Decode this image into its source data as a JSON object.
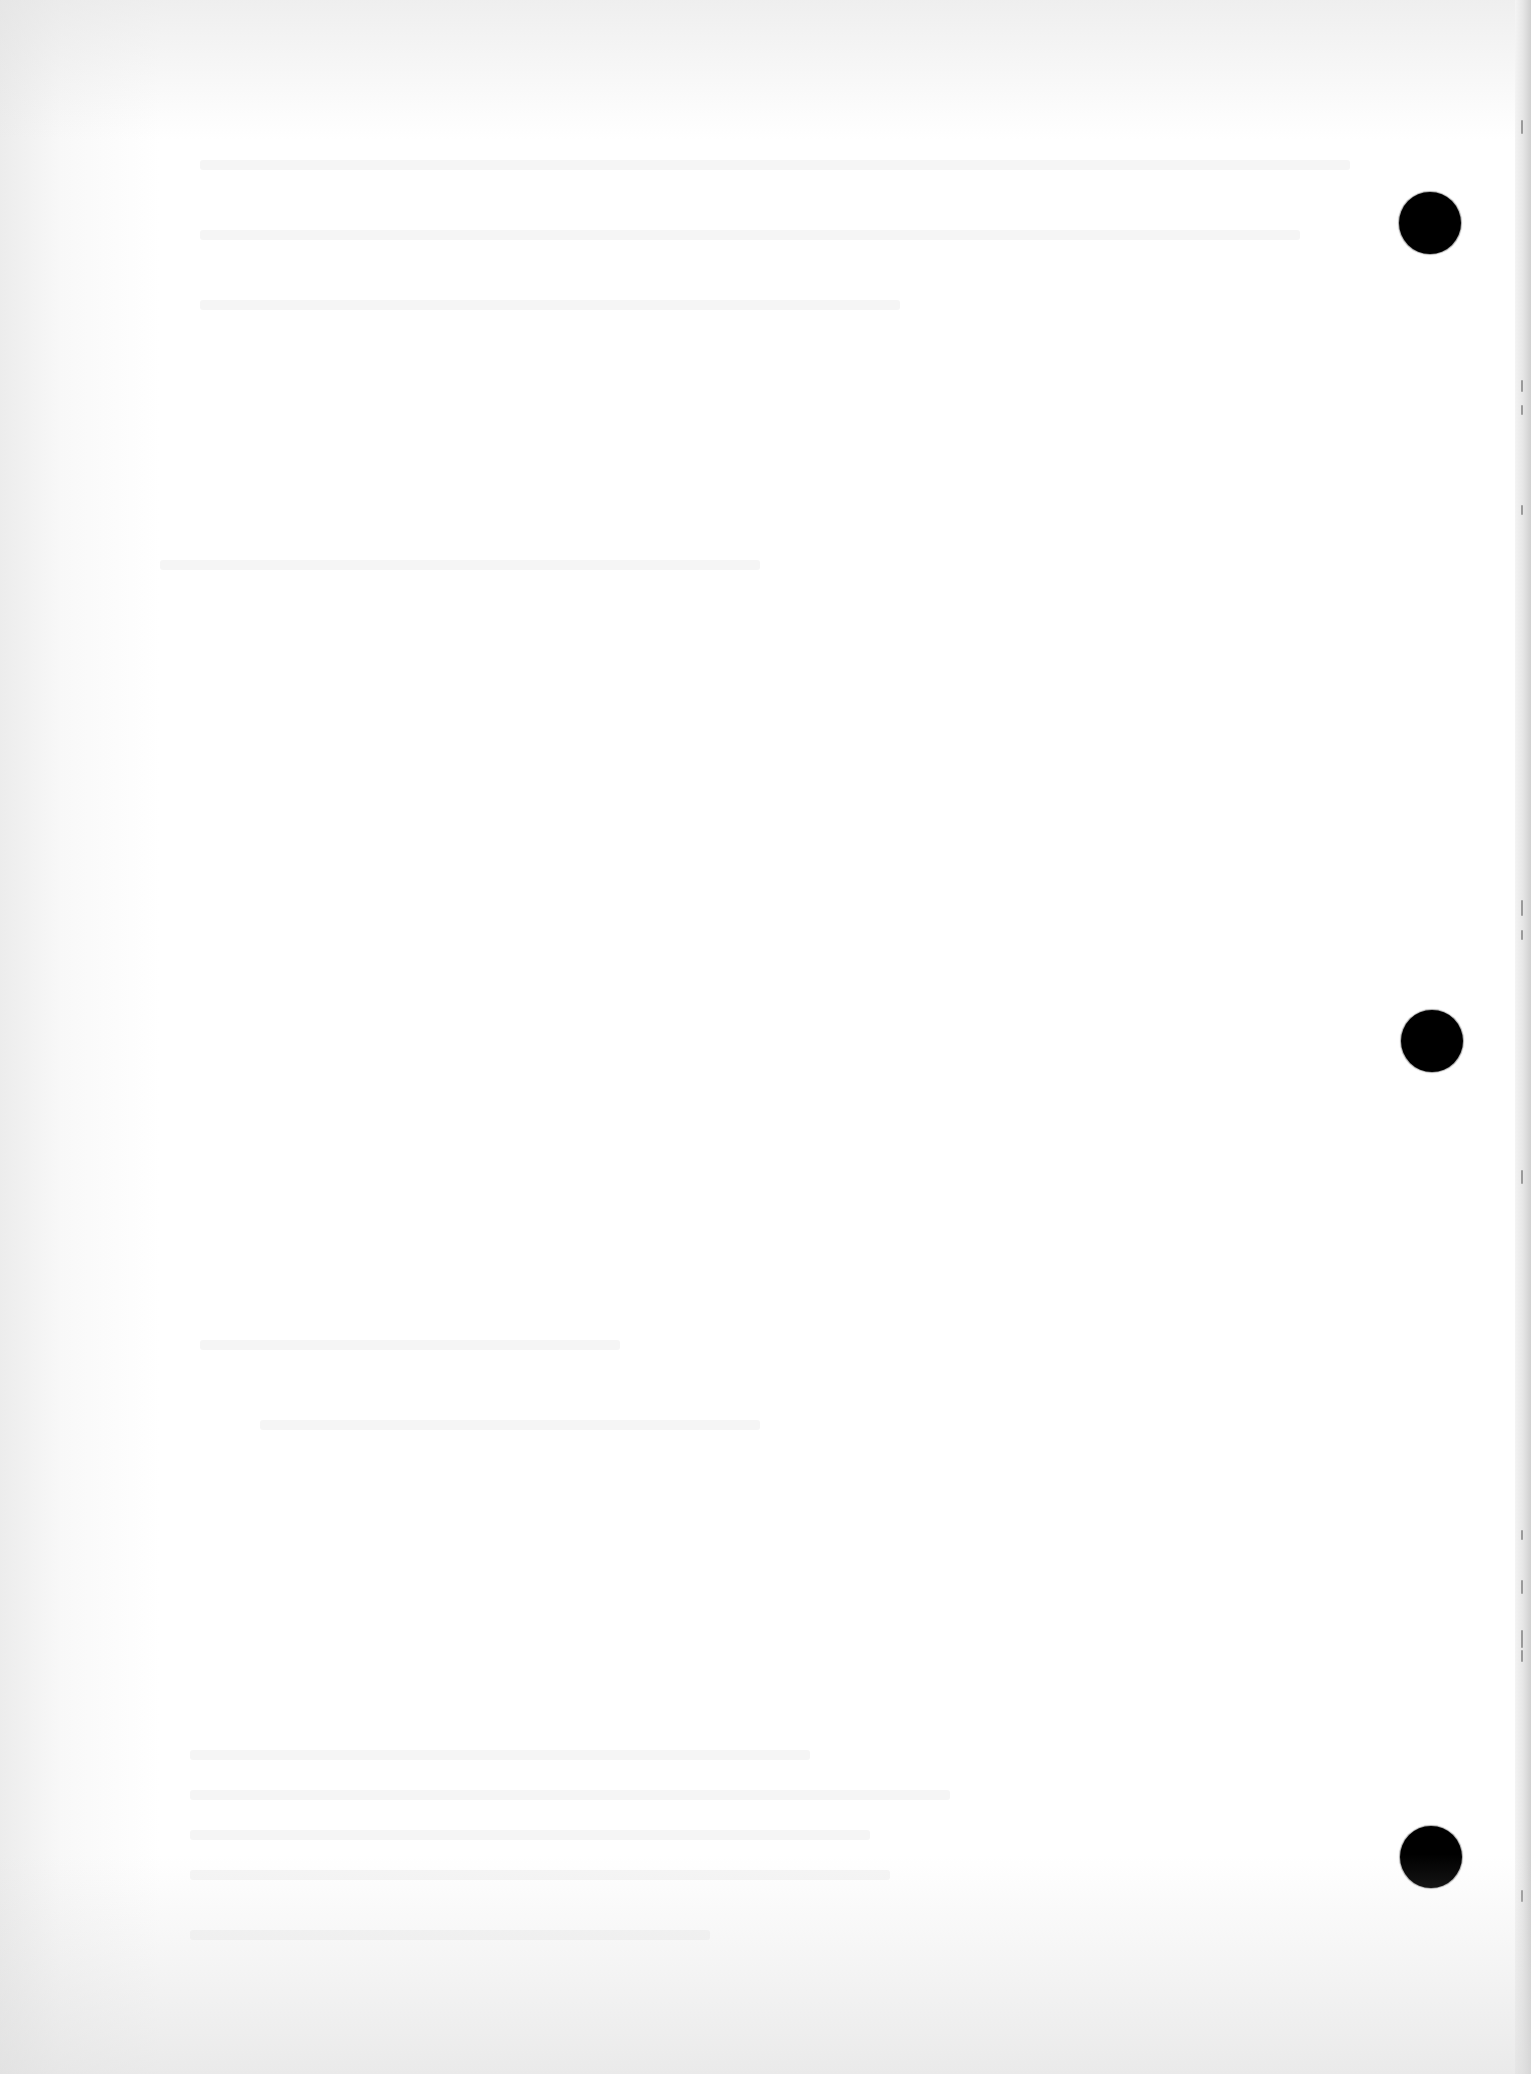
{
  "document": {
    "type": "scanned blank page",
    "background_color": "#ffffff",
    "text_content": ""
  },
  "punch_holes": [
    {
      "name": "top",
      "cx": 1430,
      "cy": 223,
      "diameter": 62,
      "color": "#000000"
    },
    {
      "name": "middle",
      "cx": 1432,
      "cy": 1041,
      "diameter": 62,
      "color": "#000000"
    },
    {
      "name": "bottom",
      "cx": 1431,
      "cy": 1857,
      "diameter": 62,
      "color": "#000000"
    }
  ],
  "edge_marks": [
    {
      "y": 120,
      "h": 14
    },
    {
      "y": 380,
      "h": 12
    },
    {
      "y": 405,
      "h": 10
    },
    {
      "y": 505,
      "h": 10
    },
    {
      "y": 900,
      "h": 16
    },
    {
      "y": 930,
      "h": 10
    },
    {
      "y": 1170,
      "h": 14
    },
    {
      "y": 1530,
      "h": 10
    },
    {
      "y": 1580,
      "h": 14
    },
    {
      "y": 1630,
      "h": 18
    },
    {
      "y": 1650,
      "h": 12
    },
    {
      "y": 1890,
      "h": 12
    }
  ],
  "bleed_through_lines": [
    {
      "x": 200,
      "y": 160,
      "w": 1150
    },
    {
      "x": 200,
      "y": 230,
      "w": 1100
    },
    {
      "x": 200,
      "y": 300,
      "w": 700
    },
    {
      "x": 160,
      "y": 560,
      "w": 600
    },
    {
      "x": 200,
      "y": 1340,
      "w": 420
    },
    {
      "x": 260,
      "y": 1420,
      "w": 500
    },
    {
      "x": 190,
      "y": 1750,
      "w": 620
    },
    {
      "x": 190,
      "y": 1790,
      "w": 760
    },
    {
      "x": 190,
      "y": 1830,
      "w": 680
    },
    {
      "x": 190,
      "y": 1870,
      "w": 700
    },
    {
      "x": 190,
      "y": 1930,
      "w": 520
    }
  ]
}
